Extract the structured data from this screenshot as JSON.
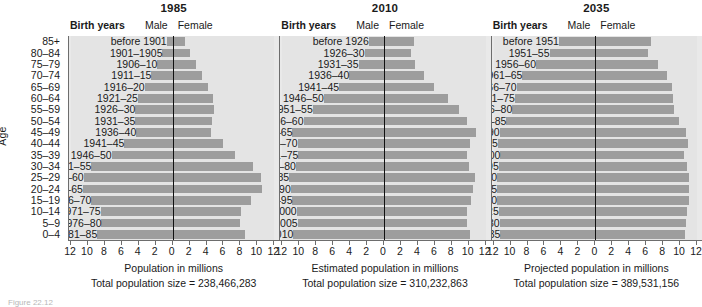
{
  "figure": {
    "age_axis_title": "Age",
    "age_groups": [
      "85+",
      "80–84",
      "75–79",
      "70–74",
      "65–69",
      "60–64",
      "55–59",
      "50–54",
      "45–49",
      "40–44",
      "35–39",
      "30–34",
      "25–29",
      "20–24",
      "15–19",
      "10–14",
      "5–9",
      "0–4"
    ],
    "header": {
      "birth_years": "Birth years",
      "male": "Male",
      "female": "Female"
    },
    "caption_partial": "Figure 22.12"
  },
  "chart_data": {
    "type": "bar",
    "chart_kind": "population-pyramid",
    "ylabel": "Age",
    "categories": [
      "85+",
      "80–84",
      "75–79",
      "70–74",
      "65–69",
      "60–64",
      "55–59",
      "50–54",
      "45–49",
      "40–44",
      "35–39",
      "30–34",
      "25–29",
      "20–24",
      "15–19",
      "10–14",
      "5–9",
      "0–4"
    ],
    "xlim": [
      -12,
      12
    ],
    "xticks": [
      -12,
      -10,
      -8,
      -6,
      -4,
      -2,
      0,
      2,
      4,
      6,
      8,
      10,
      12
    ],
    "xticklabels": [
      "12",
      "10",
      "8",
      "6",
      "4",
      "2",
      "0",
      "2",
      "4",
      "6",
      "8",
      "10",
      "12"
    ],
    "grid": false,
    "legend": [
      "Male",
      "Female"
    ],
    "legend_position": "top",
    "bar_color": "#9d9d9d",
    "panel_bg": "#e9e9e9",
    "panels": [
      {
        "year": "1985",
        "xlabel": "Population in millions",
        "total_label": "Total population size = 238,466,283",
        "total_population": 238466283,
        "birth_years": [
          "before 1901",
          "1901–1905",
          "1906–10",
          "1911–15",
          "1916–20",
          "1921–25",
          "1926–30",
          "1931–35",
          "1936–40",
          "1941–45",
          "1946–50",
          "1951–55",
          "1956–60",
          "1961–65",
          "1966–70",
          "1971–75",
          "1976–80",
          "1981–85"
        ],
        "series": [
          {
            "name": "Male",
            "values": [
              0.7,
              1.2,
              1.8,
              2.5,
              3.3,
              4.1,
              4.4,
              4.4,
              4.3,
              5.7,
              7.2,
              9.6,
              10.5,
              10.6,
              9.6,
              8.5,
              8.4,
              8.9
            ]
          },
          {
            "name": "Female",
            "values": [
              1.4,
              2.1,
              2.8,
              3.5,
              4.2,
              4.8,
              4.9,
              4.7,
              4.5,
              5.9,
              7.3,
              9.5,
              10.4,
              10.5,
              9.3,
              8.1,
              8.0,
              8.5
            ]
          }
        ]
      },
      {
        "year": "2010",
        "xlabel": "Estimated population in millions",
        "total_label": "Total population size = 310,232,863",
        "total_population": 310232863,
        "birth_years": [
          "before 1926",
          "1926–30",
          "1931–35",
          "1936–40",
          "1941–45",
          "1946–50",
          "1951–55",
          "1956–60",
          "1961–65",
          "1966–70",
          "1971–75",
          "1976–80",
          "1981–85",
          "1986–90",
          "1991–95",
          "1996–2000",
          "2001–2005",
          "2006–2010"
        ],
        "series": [
          {
            "name": "Male",
            "values": [
              1.8,
              2.3,
              3.0,
              4.1,
              5.3,
              7.1,
              8.4,
              9.5,
              10.8,
              10.2,
              10.1,
              10.4,
              11.2,
              11.0,
              10.8,
              10.3,
              10.2,
              10.7
            ]
          },
          {
            "name": "Female",
            "values": [
              3.6,
              3.2,
              3.7,
              4.7,
              5.9,
              7.6,
              8.8,
              9.8,
              10.9,
              10.1,
              9.8,
              10.0,
              10.7,
              10.5,
              10.3,
              9.8,
              9.8,
              10.2
            ]
          }
        ]
      },
      {
        "year": "2035",
        "xlabel": "Projected population in millions",
        "total_label": "Total population size = 389,531,156",
        "total_population": 389531156,
        "birth_years": [
          "before 1951",
          "1951–55",
          "1956–60",
          "1961–65",
          "1966–70",
          "1971–75",
          "1976–80",
          "1981–85",
          "1986–90",
          "1991–95",
          "1996–2000",
          "2001–05",
          "2006–10",
          "2011–15",
          "2016–20",
          "2021–25",
          "2026–30",
          "2031–35"
        ],
        "series": [
          {
            "name": "Male",
            "values": [
              4.3,
              5.4,
              7.0,
              8.6,
              9.3,
              9.5,
              9.8,
              10.5,
              11.3,
              11.5,
              11.2,
              11.4,
              11.6,
              11.6,
              11.6,
              11.4,
              11.3,
              11.2
            ]
          },
          {
            "name": "Female",
            "values": [
              6.6,
              6.2,
              7.4,
              8.5,
              9.1,
              9.2,
              9.3,
              9.9,
              10.7,
              10.9,
              10.5,
              10.8,
              11.0,
              11.0,
              11.0,
              10.8,
              10.7,
              10.6
            ]
          }
        ]
      }
    ]
  }
}
